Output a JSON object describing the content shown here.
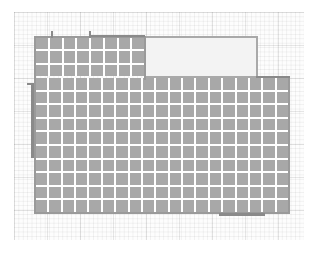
{
  "diagram": {
    "type": "floor-plan-tile-grid",
    "colors": {
      "tile": "#a8a8a8",
      "grout": "#ffffff",
      "wall": "#8a8a8a",
      "empty_area": "#f3f3f3",
      "grid_paper_line": "#e0e0e0"
    },
    "top_section": {
      "columns": 8,
      "rows": 3
    },
    "main_section": {
      "columns": 19,
      "rows": 10
    },
    "empty_region": {
      "label": ""
    }
  }
}
